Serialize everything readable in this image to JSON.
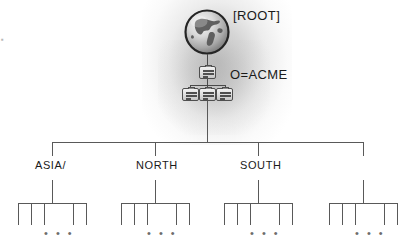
{
  "diagram": {
    "type": "hierarchical-directory-tree",
    "root": {
      "icon": "globe-icon",
      "label": "[ROOT]"
    },
    "organization": {
      "icon": "server-node-icon",
      "label": "O=ACME",
      "children_icons": [
        "server-node-icon",
        "server-node-icon",
        "server-node-icon"
      ]
    },
    "branches": [
      {
        "label": "ASIA/",
        "leaf_ticks": 5,
        "ellipsis": "• • •"
      },
      {
        "label": "NORTH",
        "leaf_ticks": 5,
        "ellipsis": "• • •"
      },
      {
        "label": "SOUTH",
        "leaf_ticks": 5,
        "ellipsis": "• • •"
      },
      {
        "label": "",
        "leaf_ticks": 5,
        "ellipsis": "• • •"
      }
    ],
    "colors": {
      "line": "#595959",
      "text": "#1a1a1a",
      "glow": "#969696",
      "icon_border": "#4f4f4f",
      "ellipsis": "#6d6d6d"
    },
    "edge_artifact": "▪"
  }
}
